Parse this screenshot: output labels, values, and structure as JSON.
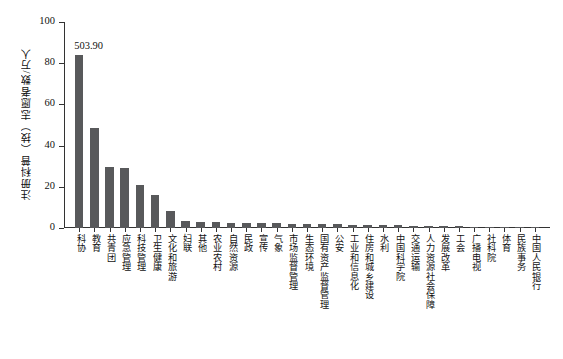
{
  "chart_data": {
    "type": "bar",
    "title": "",
    "xlabel": "",
    "ylabel": "注册科普（技）志愿者数/万人",
    "ylim": [
      0,
      100
    ],
    "yticks": [
      0,
      20,
      40,
      60,
      80,
      100
    ],
    "grid": false,
    "legend": null,
    "bar_color": "#58595b",
    "annotations": [
      {
        "category": "科协",
        "text": "503.90"
      }
    ],
    "categories": [
      "科协",
      "教育",
      "共青团",
      "应急管理",
      "科技管理",
      "卫生健康",
      "文化和旅游",
      "妇联",
      "其他",
      "农业农村",
      "自然资源",
      "民政",
      "宣传",
      "气象",
      "市场监督管理",
      "生态环境",
      "国有资产监督管理",
      "公安",
      "工业和信息化",
      "住房和城乡建设",
      "水利",
      "中国科学院",
      "交通运输",
      "人力资源社会保障",
      "发展改革",
      "工会",
      "广播电视",
      "社科院",
      "体育",
      "民族事务",
      "中国人民银行"
    ],
    "values": [
      84.0,
      48.6,
      29.4,
      29.0,
      21.0,
      16.2,
      8.4,
      3.4,
      3.0,
      2.8,
      2.6,
      2.5,
      2.3,
      2.2,
      2.1,
      2.0,
      1.9,
      1.8,
      1.6,
      1.5,
      1.4,
      1.3,
      1.1,
      1.0,
      0.9,
      0.8,
      0.7,
      0.6,
      0.5,
      0.4,
      0.3
    ]
  }
}
